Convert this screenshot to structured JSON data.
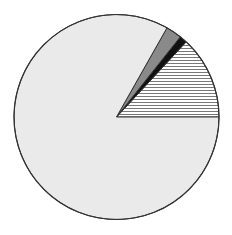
{
  "chart_data": {
    "type": "pie",
    "title": "",
    "legend": "none",
    "start_angle_deg": 0,
    "direction": "counterclockwise",
    "slices": [
      {
        "label": "",
        "value": 13.1,
        "fill": "hatch",
        "color": "#ffffff",
        "hatch_color": "#555555"
      },
      {
        "label": "",
        "value": 1.2,
        "fill": "solid",
        "color": "#111111"
      },
      {
        "label": "",
        "value": 2.5,
        "fill": "solid",
        "color": "#8a8a8a"
      },
      {
        "label": "",
        "value": 83.2,
        "fill": "solid",
        "color": "#eaeaea"
      }
    ],
    "outline_color": "#333333"
  }
}
